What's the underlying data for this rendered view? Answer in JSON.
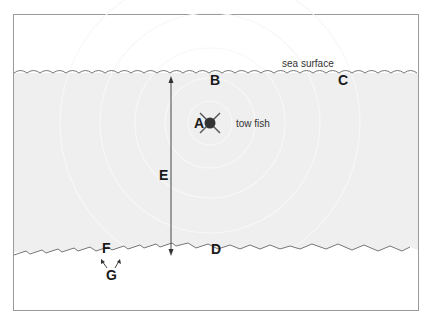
{
  "diagram": {
    "labels": {
      "surface": "sea surface",
      "towfish": "tow fish",
      "A": "A",
      "B": "B",
      "C": "C",
      "D": "D",
      "E": "E",
      "F": "F",
      "G": "G"
    },
    "colors": {
      "frame": "#9a9a9a",
      "water": "#efefef",
      "line": "#555555",
      "towfish": "#333333"
    }
  }
}
